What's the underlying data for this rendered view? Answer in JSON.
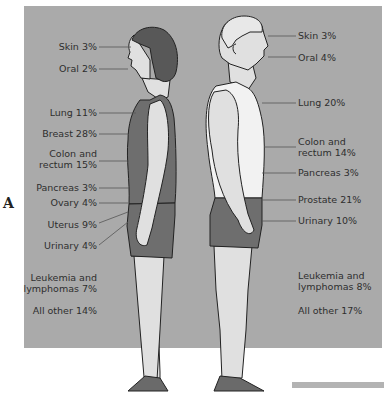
{
  "figure_label": "A",
  "female": {
    "labels": [
      {
        "text": "Skin  3%"
      },
      {
        "text": "Oral  2%"
      },
      {
        "text": "Lung  11%"
      },
      {
        "text": "Breast  28%"
      },
      {
        "line1": "Colon and",
        "line2": "rectum  15%"
      },
      {
        "text": "Pancreas  3%"
      },
      {
        "text": "Ovary  4%"
      },
      {
        "text": "Uterus  9%"
      },
      {
        "text": "Urinary  4%"
      },
      {
        "line1": "Leukemia and",
        "line2": "lymphomas  7%"
      },
      {
        "text": "All other  14%"
      }
    ]
  },
  "male": {
    "labels": [
      {
        "text": "Skin  3%"
      },
      {
        "text": "Oral  4%"
      },
      {
        "text": "Lung  20%"
      },
      {
        "line1": "Colon and",
        "line2": "rectum  14%"
      },
      {
        "text": "Pancreas  3%"
      },
      {
        "text": "Prostate  21%"
      },
      {
        "text": "Urinary  10%"
      },
      {
        "line1": "Leukemia and",
        "line2": "lymphomas  8%"
      },
      {
        "text": "All other  17%"
      }
    ]
  },
  "colors": {
    "background": "#aaaaaa",
    "clothing": "#6e6e6e",
    "skin": "#e0e0e0",
    "hair_female": "#585858",
    "shirt_male": "#f2f2f2"
  }
}
